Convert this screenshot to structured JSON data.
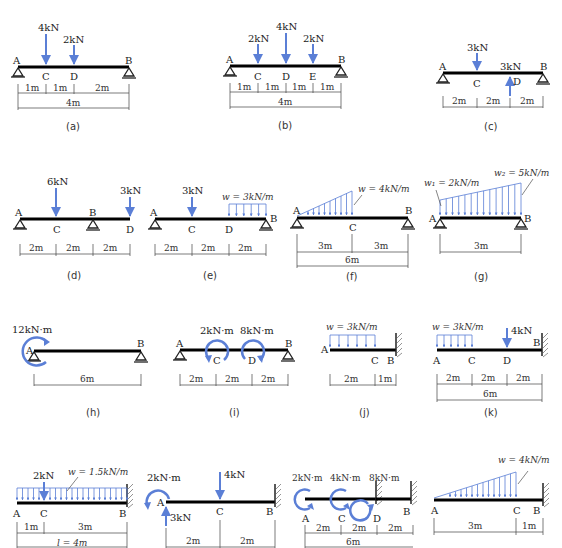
{
  "colors": {
    "beam": "#000000",
    "load": "#5b7fd6",
    "dim": "#444444",
    "text": "#222222"
  },
  "figures": [
    {
      "id": "a",
      "caption": "(a)",
      "type": "simply-supported",
      "points": [
        "A",
        "C",
        "D",
        "B"
      ],
      "loads": [
        {
          "label": "4kN",
          "at": "C",
          "kind": "point-down"
        },
        {
          "label": "2kN",
          "at": "D",
          "kind": "point-down"
        }
      ],
      "dims": [
        "1m",
        "1m",
        "2m"
      ],
      "total": "4m"
    },
    {
      "id": "b",
      "caption": "(b)",
      "type": "simply-supported",
      "points": [
        "A",
        "C",
        "D",
        "E",
        "B"
      ],
      "loads": [
        {
          "label": "2kN",
          "at": "C",
          "kind": "point-down"
        },
        {
          "label": "4kN",
          "at": "D",
          "kind": "point-down"
        },
        {
          "label": "2kN",
          "at": "E",
          "kind": "point-down"
        }
      ],
      "dims": [
        "1m",
        "1m",
        "1m",
        "1m"
      ],
      "total": "4m"
    },
    {
      "id": "c",
      "caption": "(c)",
      "type": "simply-supported",
      "points": [
        "A",
        "C",
        "D",
        "B"
      ],
      "loads": [
        {
          "label": "3kN",
          "at": "C",
          "kind": "point-down"
        },
        {
          "label": "3kN",
          "at": "D",
          "kind": "point-up"
        }
      ],
      "dims": [
        "2m",
        "2m",
        "2m"
      ]
    },
    {
      "id": "d",
      "caption": "(d)",
      "type": "overhang",
      "points": [
        "A",
        "C",
        "B",
        "D"
      ],
      "loads": [
        {
          "label": "6kN",
          "at": "C",
          "kind": "point-down"
        },
        {
          "label": "3kN",
          "at": "D",
          "kind": "point-down"
        }
      ],
      "dims": [
        "2m",
        "2m",
        "2m"
      ]
    },
    {
      "id": "e",
      "caption": "(e)",
      "type": "simply-supported",
      "points": [
        "A",
        "C",
        "D",
        "B"
      ],
      "loads": [
        {
          "label": "3kN",
          "at": "C",
          "kind": "point-down"
        },
        {
          "label": "w = 3kN/m",
          "from": "D",
          "to": "B",
          "kind": "uniform"
        }
      ],
      "dims": [
        "2m",
        "2m",
        "2m"
      ]
    },
    {
      "id": "f",
      "caption": "(f)",
      "type": "simply-supported",
      "points": [
        "A",
        "C",
        "B"
      ],
      "loads": [
        {
          "label": "w = 4kN/m",
          "from": "A",
          "to": "C",
          "kind": "triangular"
        }
      ],
      "dims": [
        "3m",
        "3m"
      ],
      "total": "6m"
    },
    {
      "id": "g",
      "caption": "(g)",
      "type": "simply-supported",
      "points": [
        "A",
        "B"
      ],
      "loads": [
        {
          "label_w1": "w₁ = 2kN/m",
          "label_w2": "w₂ = 5kN/m",
          "from": "A",
          "to": "B",
          "kind": "trapezoidal"
        }
      ],
      "dims": [
        "3m"
      ]
    },
    {
      "id": "h",
      "caption": "(h)",
      "type": "simply-supported",
      "points": [
        "A",
        "B"
      ],
      "loads": [
        {
          "label": "12kN·m",
          "at": "A",
          "kind": "moment-cw"
        }
      ],
      "dims": [
        "6m"
      ]
    },
    {
      "id": "i",
      "caption": "(i)",
      "type": "simply-supported",
      "points": [
        "A",
        "C",
        "D",
        "B"
      ],
      "loads": [
        {
          "label": "2kN·m",
          "at": "C",
          "kind": "moment-ccw"
        },
        {
          "label": "8kN·m",
          "at": "D",
          "kind": "moment-cw"
        }
      ],
      "dims": [
        "2m",
        "2m",
        "2m"
      ]
    },
    {
      "id": "j",
      "caption": "(j)",
      "type": "cantilever",
      "points": [
        "A",
        "C",
        "B"
      ],
      "loads": [
        {
          "label": "w = 3kN/m",
          "from": "A",
          "to": "C",
          "kind": "uniform"
        }
      ],
      "dims": [
        "2m",
        "1m"
      ]
    },
    {
      "id": "k",
      "caption": "(k)",
      "type": "cantilever",
      "points": [
        "A",
        "C",
        "D",
        "B"
      ],
      "loads": [
        {
          "label": "w = 3kN/m",
          "from": "A",
          "to": "C",
          "kind": "uniform"
        },
        {
          "label": "4kN",
          "at": "D",
          "kind": "point-down"
        }
      ],
      "dims": [
        "2m",
        "2m",
        "2m"
      ],
      "total": "6m"
    },
    {
      "id": "l",
      "type": "cantilever",
      "points": [
        "A",
        "C",
        "B"
      ],
      "loads": [
        {
          "label": "2kN",
          "at": "C",
          "kind": "point-down"
        },
        {
          "label": "w = 1.5kN/m",
          "from": "A",
          "to": "B",
          "kind": "uniform"
        }
      ],
      "dims": [
        "1m",
        "3m"
      ],
      "total": "l = 4m"
    },
    {
      "id": "m",
      "type": "cantilever",
      "points": [
        "A",
        "C",
        "B"
      ],
      "loads": [
        {
          "label": "2kN·m",
          "at": "A",
          "kind": "moment-ccw"
        },
        {
          "label": "3kN",
          "at": "A",
          "kind": "point-up"
        },
        {
          "label": "4kN",
          "at": "C",
          "kind": "point-down"
        }
      ],
      "dims": [
        "2m",
        "2m"
      ]
    },
    {
      "id": "n",
      "type": "cantilever",
      "points": [
        "A",
        "C",
        "D",
        "B"
      ],
      "loads": [
        {
          "label": "2kN·m",
          "at": "A",
          "kind": "moment-ccw"
        },
        {
          "label": "4kN·m",
          "at": "C",
          "kind": "moment-ccw"
        },
        {
          "label": "8kN·m",
          "at": "D",
          "kind": "moment-cw"
        }
      ],
      "dims": [
        "2m",
        "2m",
        "2m"
      ],
      "total": "6m"
    },
    {
      "id": "o",
      "type": "cantilever",
      "points": [
        "A",
        "C",
        "B"
      ],
      "loads": [
        {
          "label": "w = 4kN/m",
          "from": "A",
          "to": "C",
          "kind": "triangular"
        }
      ],
      "dims": [
        "3m",
        "1m"
      ]
    }
  ]
}
